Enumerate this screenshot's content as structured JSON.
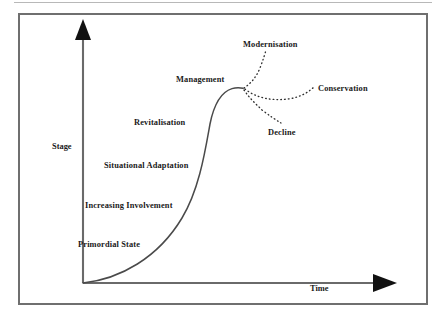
{
  "figure": {
    "type": "diagram",
    "subtype": "conceptual-curve",
    "axes": {
      "y_label": "Stage",
      "x_label": "Time"
    },
    "stage_labels": [
      {
        "id": "primordial-state",
        "text": "Primordial State",
        "x": 78,
        "y": 241
      },
      {
        "id": "increasing-involvement",
        "text": "Increasing Involvement",
        "x": 85,
        "y": 202
      },
      {
        "id": "situational-adaptation",
        "text": "Situational Adaptation",
        "x": 104,
        "y": 162
      },
      {
        "id": "revitalisation",
        "text": "Revitalisation",
        "x": 134,
        "y": 119
      },
      {
        "id": "management",
        "text": "Management",
        "x": 176,
        "y": 76
      }
    ],
    "branch_labels": [
      {
        "id": "modernisation",
        "text": "Modernisation",
        "x": 243,
        "y": 41
      },
      {
        "id": "conservation",
        "text": "Conservation",
        "x": 318,
        "y": 85
      },
      {
        "id": "decline",
        "text": "Decline",
        "x": 268,
        "y": 129
      }
    ],
    "colors": {
      "frame_border": "#6f6f6f",
      "top_rule": "#b8b8b8",
      "axis": "#5a5a5a",
      "curve": "#4a4a4a",
      "dotted_branch": "#3a3a3a",
      "text": "#1a1a1a",
      "background": "#ffffff"
    },
    "geometry": {
      "origin": [
        83,
        283
      ],
      "y_axis_top": [
        83,
        22
      ],
      "x_axis_end": [
        395,
        283
      ],
      "curve_peak": [
        237,
        88
      ],
      "branch_point": [
        243,
        88
      ]
    }
  }
}
